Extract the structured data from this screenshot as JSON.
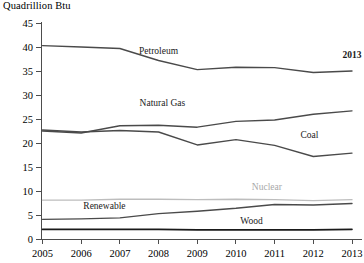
{
  "chart_data": {
    "type": "line",
    "title": "",
    "ylabel": "Quadrillion Btu",
    "xlabel": "",
    "ylim": [
      0,
      45
    ],
    "yticks": [
      0,
      5,
      10,
      15,
      20,
      25,
      30,
      35,
      40,
      45
    ],
    "grid": false,
    "legend": "inline-labels",
    "categories": [
      2005,
      2006,
      2007,
      2008,
      2009,
      2010,
      2011,
      2012,
      2013
    ],
    "x_tick_labels": [
      "2005",
      "2006",
      "2007",
      "2008",
      "2009",
      "2010",
      "2011",
      "2012",
      "2013"
    ],
    "y_tick_labels": [
      "0",
      "5",
      "10",
      "15",
      "20",
      "25",
      "30",
      "35",
      "40",
      "45"
    ],
    "annotations": [
      {
        "text": "2013",
        "series": "year-callout",
        "x": 2013,
        "y": 37.8
      }
    ],
    "series": [
      {
        "name": "Petroleum",
        "label": "Petroleum",
        "color": "#4a4a4a",
        "width": 1.4,
        "label_x": 2008,
        "label_y": 38.6,
        "values": [
          40.4,
          40.1,
          39.8,
          37.3,
          35.4,
          35.9,
          35.8,
          34.8,
          35.1
        ]
      },
      {
        "name": "Natural Gas",
        "label": "Natural Gas",
        "color": "#4a4a4a",
        "width": 1.4,
        "label_x": 2008.1,
        "label_y": 27.8,
        "values": [
          22.6,
          22.2,
          23.7,
          23.8,
          23.4,
          24.6,
          24.9,
          26.1,
          26.8
        ]
      },
      {
        "name": "Coal",
        "label": "Coal",
        "color": "#4a4a4a",
        "width": 1.4,
        "label_x": 2011.9,
        "label_y": 21.2,
        "values": [
          22.8,
          22.4,
          22.7,
          22.4,
          19.7,
          20.8,
          19.6,
          17.3,
          18.0
        ]
      },
      {
        "name": "Nuclear",
        "label": "Nuclear",
        "color": "#bdbdbd",
        "width": 1.4,
        "label_x": 2010.8,
        "label_y": 10.4,
        "values": [
          8.2,
          8.2,
          8.4,
          8.4,
          8.3,
          8.4,
          8.3,
          8.1,
          8.3
        ]
      },
      {
        "name": "Renewable",
        "label": "Renewable",
        "color": "#4a4a4a",
        "width": 1.4,
        "label_x": 2006.6,
        "label_y": 6.4,
        "values": [
          4.2,
          4.3,
          4.5,
          5.4,
          5.9,
          6.5,
          7.3,
          7.2,
          7.5
        ]
      },
      {
        "name": "Wood",
        "label": "Wood",
        "color": "#1a1a1a",
        "width": 1.6,
        "label_x": 2010.4,
        "label_y": 3.3,
        "values": [
          2.1,
          2.1,
          2.1,
          2.1,
          2.0,
          2.0,
          2.0,
          2.0,
          2.1
        ]
      }
    ]
  }
}
